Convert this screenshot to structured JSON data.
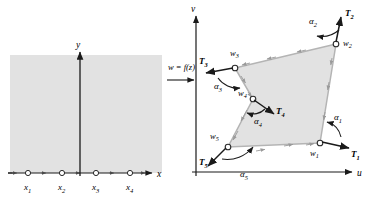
{
  "figure": {
    "colors": {
      "region_fill": "#e2e2e2",
      "region_stroke": "#b4b4b4",
      "axis": "#1a1a1a",
      "text": "#000000",
      "vertex_fill": "#ffffff"
    }
  },
  "left_panel": {
    "name": "z-plane",
    "axis_x_label": "x",
    "axis_y_label": "y",
    "region_description": "shaded upper half-plane",
    "marked_points": [
      {
        "label": "x",
        "sub": "1",
        "cx": 28,
        "cy": 177
      },
      {
        "label": "x",
        "sub": "2",
        "cx": 62,
        "cy": 177
      },
      {
        "label": "x",
        "sub": "3",
        "cx": 96,
        "cy": 177
      },
      {
        "label": "x",
        "sub": "4",
        "cx": 130,
        "cy": 177
      }
    ]
  },
  "mapping": {
    "formula": "w = f(z)",
    "arrow": "right-arrow"
  },
  "right_panel": {
    "name": "w-plane",
    "axis_u_label": "u",
    "axis_v_label": "v",
    "region_description": "shaded polygon interior",
    "vertices": [
      {
        "label": "w",
        "sub": "1",
        "x": 320,
        "y": 143,
        "lx": 310,
        "ly": 154
      },
      {
        "label": "w",
        "sub": "2",
        "x": 336,
        "y": 44,
        "lx": 346,
        "ly": 44
      },
      {
        "label": "w",
        "sub": "3",
        "x": 235,
        "y": 68,
        "lx": 232,
        "ly": 57
      },
      {
        "label": "w",
        "sub": "4",
        "x": 253,
        "y": 99,
        "lx": 243,
        "ly": 97
      },
      {
        "label": "w",
        "sub": "5",
        "x": 228,
        "y": 147,
        "lx": 215,
        "ly": 139
      }
    ],
    "tangents": [
      {
        "label": "T",
        "sub": "1",
        "lx": 352,
        "ly": 152
      },
      {
        "label": "T",
        "sub": "2",
        "lx": 352,
        "ly": 14
      },
      {
        "label": "T",
        "sub": "3",
        "lx": 203,
        "ly": 62
      },
      {
        "label": "T",
        "sub": "4",
        "lx": 279,
        "ly": 110
      },
      {
        "label": "T",
        "sub": "5",
        "lx": 205,
        "ly": 163
      }
    ],
    "angles": [
      {
        "label": "α",
        "sub": "1",
        "lx": 332,
        "ly": 117
      },
      {
        "label": "α",
        "sub": "2",
        "lx": 316,
        "ly": 22
      },
      {
        "label": "α",
        "sub": "3",
        "lx": 222,
        "ly": 86
      },
      {
        "label": "α",
        "sub": "4",
        "lx": 260,
        "ly": 123
      },
      {
        "label": "α",
        "sub": "5",
        "lx": 245,
        "ly": 175
      }
    ]
  }
}
